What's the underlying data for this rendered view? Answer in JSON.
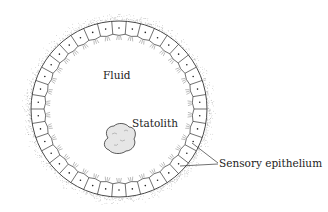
{
  "diagram": {
    "type": "statocyst-cross-section",
    "labels": {
      "fluid": "Fluid",
      "statolith": "Statolith",
      "epithelium": "Sensory epithelium"
    },
    "geometry": {
      "center": [
        119,
        109
      ],
      "outer_radius": 88,
      "inner_radius": 74,
      "cell_count": 38
    },
    "colors": {
      "line": "#333333",
      "stipple": "#9a9a9a",
      "statolith_fill": "#e4e4e4"
    }
  }
}
